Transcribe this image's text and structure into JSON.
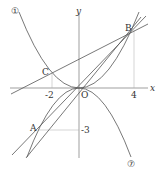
{
  "axes": {
    "x_label": "x",
    "y_label": "y",
    "origin_label": "O"
  },
  "ticks": {
    "x_neg2": "-2",
    "x_4": "4",
    "y_neg3": "-3"
  },
  "points": {
    "A": "A",
    "B": "B",
    "C": "C"
  },
  "curves": {
    "curve1_label": "①",
    "curve2_label": "⑦"
  },
  "colors": {
    "line": "#555555",
    "guide": "#999999",
    "text": "#333333"
  }
}
